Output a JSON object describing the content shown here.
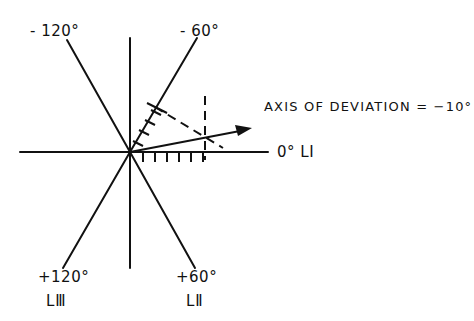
{
  "diagram": {
    "origin": [
      130,
      152
    ],
    "labels": {
      "minus_120": "- 120°",
      "minus_60": "- 60°",
      "plus_120": "+120°",
      "plus_60": "+60°",
      "lead_III": "LⅢ",
      "lead_II": "LⅡ",
      "zero_lead_I": "0° LⅠ",
      "axis_of_deviation": "AXIS OF DEVIATION = −10°"
    },
    "axes": [
      {
        "name": "lead-I",
        "angle_deg": 0
      },
      {
        "name": "aVF",
        "angle_deg": 90
      },
      {
        "name": "lead-II",
        "angle_deg": 60
      },
      {
        "name": "lead-III",
        "angle_deg": 120
      }
    ],
    "deviation_axis_deg": -10,
    "tick_marks": {
      "lead_I_count": 7,
      "minus_60_count": 5
    },
    "line_color": "#111111"
  }
}
